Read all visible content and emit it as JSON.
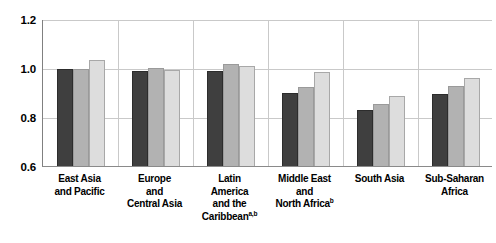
{
  "chart_data": {
    "type": "bar",
    "title": "",
    "subtitle": "",
    "xlabel": "",
    "ylabel": "",
    "ylim": [
      0.6,
      1.2
    ],
    "yticks": [
      0.6,
      0.8,
      1.0,
      1.2
    ],
    "ytick_labels": [
      "0.6",
      "0.8",
      "1.0",
      "1.2"
    ],
    "grid": true,
    "legend": "none",
    "categories": [
      "East Asia and Pacific",
      "Europe and Central Asia",
      "Latin America and the Caribbean",
      "Middle East and North Africa",
      "South Asia",
      "Sub-Saharan Africa"
    ],
    "category_lines": [
      [
        "East Asia",
        "and Pacific"
      ],
      [
        "Europe",
        "and",
        "Central Asia"
      ],
      [
        "Latin",
        "America",
        "and the",
        "Caribbean"
      ],
      [
        "Middle East",
        "and",
        "North Africa"
      ],
      [
        "South Asia"
      ],
      [
        "Sub-Saharan",
        "Africa"
      ]
    ],
    "category_footnotes": [
      "",
      "",
      "a,b",
      "b",
      "",
      ""
    ],
    "series": [
      {
        "name": "series-1",
        "color": "#3f3f3f",
        "values": [
          0.995,
          0.988,
          0.988,
          0.9,
          0.83,
          0.895
        ]
      },
      {
        "name": "series-2",
        "color": "#b2b2b2",
        "values": [
          0.996,
          1.002,
          1.016,
          0.922,
          0.855,
          0.925
        ]
      },
      {
        "name": "series-3",
        "color": "#dddddd",
        "values": [
          1.032,
          0.99,
          1.01,
          0.985,
          0.885,
          0.96
        ]
      }
    ]
  }
}
